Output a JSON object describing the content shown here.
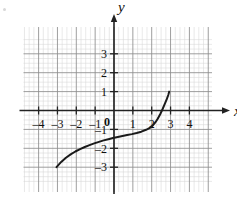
{
  "figure": {
    "background_color": "#ffffff",
    "curve_color": "#1a1a1a",
    "axis_color": "#222222",
    "major_grid_color": "#8d8d8d",
    "minor_grid_color": "#d6d6d6"
  },
  "labels": {
    "x_axis_name": "x",
    "y_axis_name": "y",
    "origin": "0"
  },
  "chart_data": {
    "type": "line",
    "title": "",
    "xlabel": "x",
    "ylabel": "y",
    "grid": true,
    "minor_grid": true,
    "minor_grid_divisions": 4,
    "legend": "none",
    "xlim": [
      -5.0,
      5.0
    ],
    "ylim": [
      -3.6,
      3.6
    ],
    "xticks": [
      -4,
      -3,
      -2,
      -1,
      1,
      2,
      3,
      4
    ],
    "xtick_labels": [
      "-4",
      "-3",
      "-2",
      "-1",
      "1",
      "2",
      "3",
      "4"
    ],
    "yticks": [
      -3,
      -2,
      -1,
      1,
      2,
      3
    ],
    "ytick_labels": [
      "-3",
      "-2",
      "-1",
      "1",
      "2",
      "3"
    ],
    "series": [
      {
        "name": "curve",
        "x": [
          -3.05,
          -2.8,
          -2.55,
          -2.3,
          -2.05,
          -1.8,
          -1.55,
          -1.3,
          -1.05,
          -0.8,
          -0.55,
          -0.3,
          -0.05,
          0.2,
          0.45,
          0.7,
          0.95,
          1.2,
          1.45,
          1.7,
          1.9,
          2.05,
          2.2,
          2.32,
          2.45,
          2.58,
          2.7,
          2.8,
          2.88,
          2.93
        ],
        "y": [
          -3.0,
          -2.72,
          -2.5,
          -2.32,
          -2.17,
          -2.04,
          -1.93,
          -1.83,
          -1.74,
          -1.66,
          -1.58,
          -1.52,
          -1.46,
          -1.4,
          -1.35,
          -1.3,
          -1.25,
          -1.19,
          -1.12,
          -1.02,
          -0.92,
          -0.8,
          -0.62,
          -0.44,
          -0.2,
          0.08,
          0.36,
          0.6,
          0.82,
          1.0
        ]
      }
    ]
  }
}
